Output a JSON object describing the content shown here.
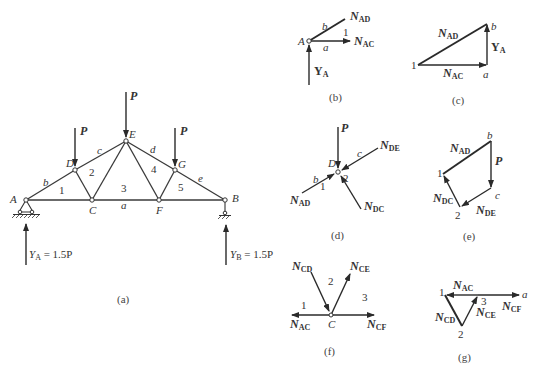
{
  "figure": {
    "panels": {
      "a": {
        "caption": "(a)",
        "nodes": {
          "A": "A",
          "B": "B",
          "C": "C",
          "D": "D",
          "E": "E",
          "F": "F",
          "G": "G"
        },
        "regions": {
          "r1": "1",
          "r2": "2",
          "r3": "3",
          "r4": "4",
          "r5": "5"
        },
        "spaces": {
          "a": "a",
          "b": "b",
          "c": "c",
          "d": "d",
          "e": "e"
        },
        "loads": {
          "pD": "P",
          "pE": "P",
          "pG": "P"
        },
        "reactions": {
          "ya_main": "Y",
          "ya_sub": "A",
          "ya_value": " = 1.5P",
          "yb_main": "Y",
          "yb_sub": "B",
          "yb_value": " = 1.5P"
        }
      },
      "b": {
        "caption": "(b)",
        "node": "A",
        "labels": {
          "b": "b",
          "a": "a",
          "one": "1"
        },
        "forces": {
          "nad_main": "N",
          "nad_sub": "AD",
          "nac_main": "N",
          "nac_sub": "AC",
          "ya_main": "Y",
          "ya_sub": "A"
        }
      },
      "c": {
        "caption": "(c)",
        "points": {
          "one": "1",
          "a": "a",
          "b": "b"
        },
        "forces": {
          "nad_main": "N",
          "nad_sub": "AD",
          "nac_main": "N",
          "nac_sub": "AC",
          "ya_main": "Y",
          "ya_sub": "A"
        }
      },
      "d": {
        "caption": "(d)",
        "node": "D",
        "labels": {
          "b": "b",
          "c": "c",
          "one": "1",
          "two": "2"
        },
        "forces": {
          "p": "P",
          "nde_main": "N",
          "nde_sub": "DE",
          "nad_main": "N",
          "nad_sub": "AD",
          "ndc_main": "N",
          "ndc_sub": "DC"
        }
      },
      "e": {
        "caption": "(e)",
        "points": {
          "b": "b",
          "c": "c",
          "one": "1",
          "two": "2"
        },
        "forces": {
          "p": "P",
          "nad_main": "N",
          "nad_sub": "AD",
          "ndc_main": "N",
          "ndc_sub": "DC",
          "nde_main": "N",
          "nde_sub": "DE"
        }
      },
      "f": {
        "caption": "(f)",
        "node": "C",
        "labels": {
          "one": "1",
          "two": "2",
          "three": "3"
        },
        "forces": {
          "ncd_main": "N",
          "ncd_sub": "CD",
          "nce_main": "N",
          "nce_sub": "CE",
          "nac_main": "N",
          "nac_sub": "AC",
          "ncf_main": "N",
          "ncf_sub": "CF"
        }
      },
      "g": {
        "caption": "(g)",
        "points": {
          "one": "1",
          "two": "2",
          "three": "3",
          "a": "a"
        },
        "forces": {
          "nac_main": "N",
          "nac_sub": "AC",
          "ncf_main": "N",
          "ncf_sub": "CF",
          "nce_main": "N",
          "nce_sub": "CE",
          "ncd_main": "N",
          "ncd_sub": "CD"
        }
      }
    }
  }
}
